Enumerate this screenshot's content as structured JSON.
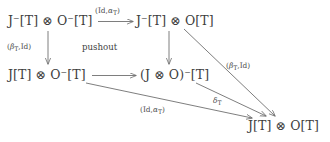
{
  "figure": {
    "type": "commutative-diagram",
    "clipped_caption": "...am",
    "nodes": [
      {
        "id": "top-left",
        "text": "J⁻[T] ⊗ O⁻[T]"
      },
      {
        "id": "top-right",
        "text": "J⁻[T] ⊗ O[T]"
      },
      {
        "id": "middle-left",
        "text": "J[T] ⊗ O⁻[T]"
      },
      {
        "id": "middle-right",
        "text": "(J ⊗ O)⁻[T]"
      },
      {
        "id": "bottom-right",
        "text": "J[T] ⊗ O[T]"
      }
    ],
    "edges": [
      {
        "id": "top",
        "label": "(Id,α_T)",
        "from": "top-left",
        "to": "top-right",
        "direction": "right"
      },
      {
        "id": "left",
        "label": "(β_T,Id)",
        "from": "top-left",
        "to": "middle-left",
        "direction": "down"
      },
      {
        "id": "center",
        "label": "",
        "from": "top-right",
        "to": "middle-right",
        "direction": "down"
      },
      {
        "id": "mid",
        "label": "",
        "from": "middle-left",
        "to": "middle-right",
        "direction": "right"
      },
      {
        "id": "right",
        "label": "(β_T,Id)",
        "from": "top-right",
        "to": "bottom-right",
        "direction": "diagonal"
      },
      {
        "id": "delta",
        "label": "δ_T",
        "from": "middle-right",
        "to": "bottom-right",
        "direction": "diagonal"
      },
      {
        "id": "bottom",
        "label": "(Id,α_T)",
        "from": "middle-left",
        "to": "bottom-right",
        "direction": "diagonal"
      }
    ],
    "annotations": [
      {
        "id": "pushout",
        "text": "pushout"
      }
    ],
    "colors": {
      "stroke": "#6f6f6f",
      "text": "#3d3d3d",
      "background": "#ffffff"
    }
  }
}
